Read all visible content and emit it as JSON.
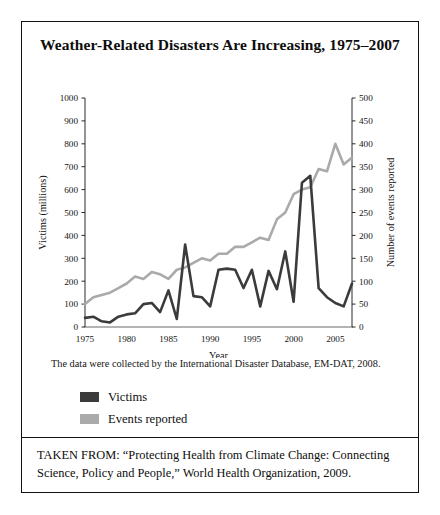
{
  "figure": {
    "title": "Weather-Related Disasters Are Increasing, 1975–2007",
    "caption": "The data were collected by the International Disaster Database, EM-DAT, 2008.",
    "source": "TAKEN FROM: “Protecting Health from Climate Change: Connecting Science, Policy and People,” World Health Organization, 2009."
  },
  "legend": {
    "items": [
      {
        "label": "Victims",
        "color": "#3b3b3b"
      },
      {
        "label": "Events reported",
        "color": "#aaaaaa"
      }
    ]
  },
  "chart_data": {
    "type": "line",
    "title": "Weather-Related Disasters Are Increasing, 1975–2007",
    "xlabel": "Year",
    "ylabel": "Victims (millions)",
    "y2label": "Number of events reported",
    "xlim": [
      1975,
      2007
    ],
    "ylim": [
      0,
      1000
    ],
    "y2lim": [
      0,
      500
    ],
    "xticks": [
      1975,
      1980,
      1985,
      1990,
      1995,
      2000,
      2005
    ],
    "yticks": [
      0,
      100,
      200,
      300,
      400,
      500,
      600,
      700,
      800,
      900,
      1000
    ],
    "y2ticks": [
      0,
      50,
      100,
      150,
      200,
      250,
      300,
      350,
      400,
      450,
      500
    ],
    "grid": false,
    "legend_position": "below-plot",
    "x": [
      1975,
      1976,
      1977,
      1978,
      1979,
      1980,
      1981,
      1982,
      1983,
      1984,
      1985,
      1986,
      1987,
      1988,
      1989,
      1990,
      1991,
      1992,
      1993,
      1994,
      1995,
      1996,
      1997,
      1998,
      1999,
      2000,
      2001,
      2002,
      2003,
      2004,
      2005,
      2006,
      2007
    ],
    "series": [
      {
        "name": "Victims",
        "axis": "left",
        "units": "millions",
        "color": "#3b3b3b",
        "values": [
          40,
          45,
          25,
          20,
          45,
          55,
          60,
          100,
          105,
          65,
          160,
          35,
          360,
          135,
          130,
          90,
          250,
          255,
          250,
          170,
          250,
          90,
          245,
          165,
          330,
          110,
          630,
          660,
          170,
          130,
          105,
          90,
          190
        ]
      },
      {
        "name": "Events reported",
        "axis": "right",
        "units": "events",
        "color": "#aaaaaa",
        "values": [
          50,
          65,
          70,
          75,
          85,
          95,
          110,
          105,
          120,
          115,
          105,
          125,
          130,
          140,
          150,
          145,
          160,
          160,
          175,
          175,
          185,
          195,
          190,
          235,
          250,
          290,
          300,
          305,
          345,
          340,
          400,
          355,
          370
        ]
      }
    ]
  },
  "axes": {
    "left_tick_labels": [
      "1000",
      "900",
      "800",
      "700",
      "600",
      "500",
      "400",
      "300",
      "200",
      "100",
      "0"
    ],
    "right_tick_labels": [
      "500",
      "450",
      "400",
      "350",
      "300",
      "250",
      "200",
      "150",
      "100",
      "50",
      "0"
    ],
    "x_tick_labels": [
      "1975",
      "1980",
      "1985",
      "1990",
      "1995",
      "2000",
      "2005"
    ],
    "x_title": "Year",
    "y_left_title": "Victims (millions)",
    "y_right_title": "Number of events reported"
  }
}
